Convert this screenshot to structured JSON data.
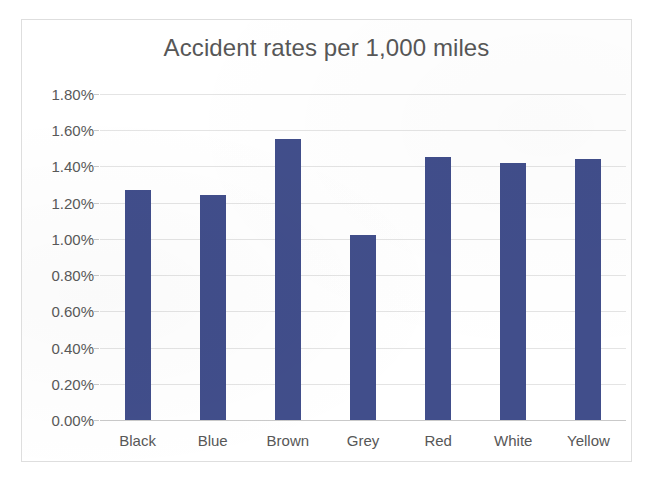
{
  "chart_data": {
    "type": "bar",
    "title": "Accident rates per 1,000 miles",
    "xlabel": "",
    "ylabel": "",
    "categories": [
      "Black",
      "Blue",
      "Brown",
      "Grey",
      "Red",
      "White",
      "Yellow"
    ],
    "values": [
      1.27,
      1.24,
      1.55,
      1.02,
      1.45,
      1.42,
      1.44
    ],
    "value_unit": "%",
    "ylim": [
      0.0,
      1.8
    ],
    "ytick_step": 0.2,
    "ytick_labels": [
      "0.00%",
      "0.20%",
      "0.40%",
      "0.60%",
      "0.80%",
      "1.00%",
      "1.20%",
      "1.40%",
      "1.60%",
      "1.80%"
    ],
    "ytick_values": [
      0.0,
      0.2,
      0.4,
      0.6,
      0.8,
      1.0,
      1.2,
      1.4,
      1.6,
      1.8
    ],
    "grid": true,
    "legend": false,
    "series": [
      {
        "name": "Accident rate",
        "color": "#414e8b",
        "values": [
          1.27,
          1.24,
          1.55,
          1.02,
          1.45,
          1.42,
          1.44
        ]
      }
    ],
    "colors": {
      "bar": "#414e8b",
      "gridline": "#e4e4e4",
      "axis": "#c9c9c9",
      "text": "#575757",
      "border": "#dedede",
      "background": "#ffffff"
    }
  }
}
